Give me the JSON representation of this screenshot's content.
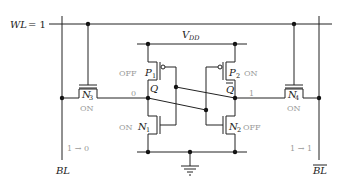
{
  "diagram": {
    "word_line": {
      "label": "WL",
      "value_text": "= 1"
    },
    "supply": {
      "label": "V",
      "subscript": "DD"
    },
    "bit_line": {
      "label": "BL",
      "transition": "1 → 0"
    },
    "bit_line_bar": {
      "label": "BL",
      "transition": "1 → 1"
    },
    "transistors": [
      {
        "id": "P1",
        "name": "P",
        "sub": "1",
        "state": "OFF",
        "type": "pmos"
      },
      {
        "id": "P2",
        "name": "P",
        "sub": "2",
        "state": "ON",
        "type": "pmos"
      },
      {
        "id": "N1",
        "name": "N",
        "sub": "1",
        "state": "ON",
        "type": "nmos"
      },
      {
        "id": "N2",
        "name": "N",
        "sub": "2",
        "state": "OFF",
        "type": "nmos"
      },
      {
        "id": "N3",
        "name": "N",
        "sub": "3",
        "state": "ON",
        "type": "nmos-access"
      },
      {
        "id": "N4",
        "name": "N",
        "sub": "4",
        "state": "ON",
        "type": "nmos-access"
      }
    ],
    "nodes": {
      "q": {
        "label": "Q",
        "value": "0"
      },
      "q_bar": {
        "label": "Q",
        "value": "1"
      }
    },
    "colors": {
      "wire": "#222222",
      "state_text": "#9a9a9a"
    }
  }
}
